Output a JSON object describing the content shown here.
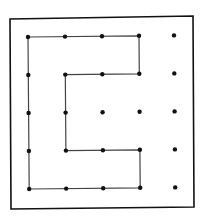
{
  "diagram": {
    "type": "dot-grid-polygon",
    "grid": {
      "rows": 5,
      "cols": 5
    },
    "colors": {
      "background": "#ffffff",
      "ink": "#111111",
      "line": "#444444"
    },
    "frame": {
      "corners": [
        [
          10,
          19
        ],
        [
          193,
          16
        ],
        [
          194,
          207
        ],
        [
          11,
          209
        ]
      ]
    },
    "dot_x": [
      28,
      65,
      102,
      139,
      174
    ],
    "dot_y": [
      37,
      75,
      113,
      151,
      189
    ],
    "polygon_path_grid": [
      [
        0,
        0
      ],
      [
        3,
        0
      ],
      [
        3,
        1
      ],
      [
        1,
        1
      ],
      [
        1,
        3
      ],
      [
        3,
        3
      ],
      [
        3,
        4
      ],
      [
        0,
        4
      ],
      [
        0,
        0
      ]
    ]
  }
}
